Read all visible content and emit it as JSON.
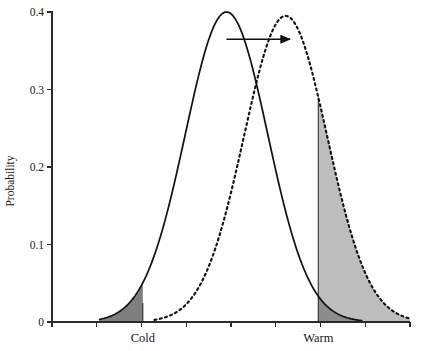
{
  "chart_data": {
    "type": "area",
    "title": "",
    "subtitle": "",
    "xlabel": "",
    "ylabel": "Probability",
    "ylim": [
      0,
      0.4
    ],
    "xlim": [
      0,
      8
    ],
    "grid": false,
    "legend": "none",
    "y_ticks": [
      {
        "value": 0,
        "label": "0"
      },
      {
        "value": 0.1,
        "label": "0.1"
      },
      {
        "value": 0.2,
        "label": "0.2"
      },
      {
        "value": 0.3,
        "label": "0.3"
      },
      {
        "value": 0.4,
        "label": "0.4"
      }
    ],
    "x_ticks": [
      0,
      1,
      2,
      3,
      4,
      5,
      6,
      7,
      8
    ],
    "x_tick_labels": [
      "",
      "",
      "",
      "",
      "",
      "",
      "",
      "",
      ""
    ],
    "annotations": [
      {
        "name": "cold-label",
        "text": "Cold",
        "x": 2.03,
        "y": -0.03
      },
      {
        "name": "warm-label",
        "text": "Warm",
        "x": 5.95,
        "y": -0.03
      },
      {
        "name": "shift-arrow",
        "text": "",
        "x_start": 3.9,
        "x_end": 5.32,
        "y": 0.365
      }
    ],
    "series": [
      {
        "name": "current-climate",
        "style": "solid",
        "distribution": "normal",
        "mean": 3.9,
        "sigma": 0.92,
        "peak": 0.4,
        "color": "#101010",
        "shaded_tail": {
          "name": "cold-extreme",
          "side": "left",
          "threshold": 2.03,
          "fill": "#7f7f7f",
          "probability": 0.0245
        }
      },
      {
        "name": "shifted-climate",
        "style": "dashed",
        "distribution": "normal",
        "mean": 5.22,
        "sigma": 0.93,
        "peak": 0.395,
        "color": "#101010",
        "shaded_tail": {
          "name": "warm-extreme",
          "side": "right",
          "threshold": 5.95,
          "fill": "#bdbdbd",
          "probability": 0.2163
        }
      }
    ],
    "thresholds": [
      {
        "name": "cold-threshold",
        "x": 2.03,
        "label": "Cold",
        "y_top": 0.0245
      },
      {
        "name": "warm-threshold",
        "x": 5.95,
        "label": "Warm",
        "y_top": 0.29
      }
    ],
    "colors": {
      "axis": "#2b2b2b",
      "curve": "#101010",
      "cold_fill": "#7f7f7f",
      "warm_fill": "#bdbdbd",
      "overlap_fill": "#8d8d8d",
      "background": "#fefefe"
    },
    "points_solid": [
      {
        "x": 1.05,
        "y": 0.003
      },
      {
        "x": 1.4,
        "y": 0.0073
      },
      {
        "x": 1.7,
        "y": 0.0145
      },
      {
        "x": 2.03,
        "y": 0.028
      },
      {
        "x": 2.4,
        "y": 0.0555
      },
      {
        "x": 2.7,
        "y": 0.095
      },
      {
        "x": 3.0,
        "y": 0.15
      },
      {
        "x": 3.3,
        "y": 0.22
      },
      {
        "x": 3.6,
        "y": 0.3
      },
      {
        "x": 3.9,
        "y": 0.4
      },
      {
        "x": 4.2,
        "y": 0.38
      },
      {
        "x": 4.5,
        "y": 0.31
      },
      {
        "x": 4.8,
        "y": 0.23
      },
      {
        "x": 5.1,
        "y": 0.155
      },
      {
        "x": 5.4,
        "y": 0.096
      },
      {
        "x": 5.7,
        "y": 0.056
      },
      {
        "x": 5.95,
        "y": 0.035
      },
      {
        "x": 6.3,
        "y": 0.0145
      },
      {
        "x": 6.6,
        "y": 0.007
      },
      {
        "x": 6.9,
        "y": 0.0028
      }
    ],
    "points_dashed": [
      {
        "x": 2.3,
        "y": 0.0025
      },
      {
        "x": 2.7,
        "y": 0.007
      },
      {
        "x": 3.0,
        "y": 0.0145
      },
      {
        "x": 3.35,
        "y": 0.029
      },
      {
        "x": 3.7,
        "y": 0.058
      },
      {
        "x": 4.0,
        "y": 0.098
      },
      {
        "x": 4.32,
        "y": 0.156
      },
      {
        "x": 4.62,
        "y": 0.225
      },
      {
        "x": 4.92,
        "y": 0.305
      },
      {
        "x": 5.22,
        "y": 0.395
      },
      {
        "x": 5.52,
        "y": 0.376
      },
      {
        "x": 5.8,
        "y": 0.315
      },
      {
        "x": 5.95,
        "y": 0.29
      },
      {
        "x": 6.15,
        "y": 0.232
      },
      {
        "x": 6.45,
        "y": 0.157
      },
      {
        "x": 6.75,
        "y": 0.0975
      },
      {
        "x": 7.05,
        "y": 0.057
      },
      {
        "x": 7.4,
        "y": 0.0285
      },
      {
        "x": 7.7,
        "y": 0.014
      },
      {
        "x": 8.0,
        "y": 0.006
      }
    ]
  },
  "axes": {
    "y_label": "Probability",
    "y_tick_labels": [
      "0",
      "0.1",
      "0.2",
      "0.3",
      "0.4"
    ]
  },
  "labels": {
    "cold": "Cold",
    "warm": "Warm"
  }
}
